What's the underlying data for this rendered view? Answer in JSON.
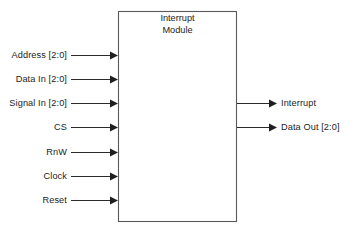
{
  "diagram": {
    "type": "block-diagram",
    "title_lines": [
      "Interrupt",
      "Module"
    ],
    "module_label": "Interrupt Module",
    "inputs": [
      {
        "label": "Address [2:0]",
        "y": 55
      },
      {
        "label": "Data In [2:0]",
        "y": 79
      },
      {
        "label": "Signal In [2:0]",
        "y": 103
      },
      {
        "label": "CS",
        "y": 127
      },
      {
        "label": "RnW",
        "y": 152
      },
      {
        "label": "Clock",
        "y": 176
      },
      {
        "label": "Reset",
        "y": 200
      }
    ],
    "outputs": [
      {
        "label": "Interrupt",
        "y": 103
      },
      {
        "label": "Data Out [2:0]",
        "y": 127
      }
    ],
    "colors": {
      "background": "#ffffff",
      "box_stroke": "#5a5a5a",
      "wire": "#2b2b2b",
      "text": "#232323"
    },
    "box": {
      "x": 118,
      "y": 11,
      "width": 119,
      "height": 211
    }
  }
}
